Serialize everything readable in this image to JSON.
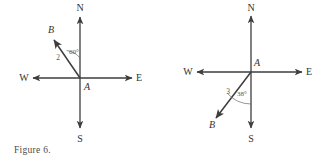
{
  "figures": [
    {
      "id": "figure-6",
      "caption": "Figure 6.",
      "center_label": "A",
      "point_label": "B",
      "length_label": "2",
      "angle_label": "60°",
      "directions": {
        "north": "N",
        "south": "S",
        "east": "E",
        "west": "W"
      },
      "ray_direction": "northwest",
      "angle_reference": "north",
      "stroke_color": "#3d3d3d",
      "text_color": "#333333"
    },
    {
      "id": "figure-7",
      "caption": "Figure 7.",
      "center_label": "A",
      "point_label": "B",
      "length_label": "3",
      "angle_label": "38°",
      "directions": {
        "north": "N",
        "south": "S",
        "east": "E",
        "west": "W"
      },
      "ray_direction": "southwest",
      "angle_reference": "south",
      "stroke_color": "#3d3d3d",
      "text_color": "#333333"
    }
  ]
}
